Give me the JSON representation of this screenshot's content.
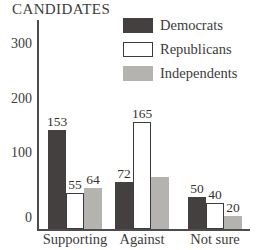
{
  "title": "CANDIDATES",
  "chart_data": {
    "type": "bar",
    "title": "CANDIDATES",
    "categories": [
      "Supporting",
      "Against",
      "Not sure"
    ],
    "series": [
      {
        "name": "Democrats",
        "color": "#454040",
        "outlined": false,
        "values": [
          153,
          72,
          50
        ],
        "value_labels": [
          "153",
          "72",
          "50"
        ]
      },
      {
        "name": "Republicans",
        "color": "#ffffff",
        "outlined": true,
        "values": [
          55,
          165,
          40
        ],
        "value_labels": [
          "55",
          "165",
          "40"
        ]
      },
      {
        "name": "Independents",
        "color": "#b5b3b0",
        "outlined": false,
        "values": [
          64,
          80,
          20
        ],
        "value_labels": [
          "64",
          "",
          "20"
        ]
      }
    ],
    "y_ticks": [
      "0",
      "100",
      "200",
      "300"
    ],
    "ylim": [
      0,
      330
    ],
    "grid": false,
    "legend_position": "top-right"
  },
  "legend": {
    "items": [
      {
        "label": "Democrats",
        "color": "#454040",
        "outlined": false
      },
      {
        "label": "Republicans",
        "color": "#ffffff",
        "outlined": true
      },
      {
        "label": "Independents",
        "color": "#b5b3b0",
        "outlined": false
      }
    ]
  },
  "colors": {
    "axis": "#4d4d4d",
    "outline": "#3c3c3c",
    "text": "#3b3b3b",
    "background": "#ffffff"
  }
}
